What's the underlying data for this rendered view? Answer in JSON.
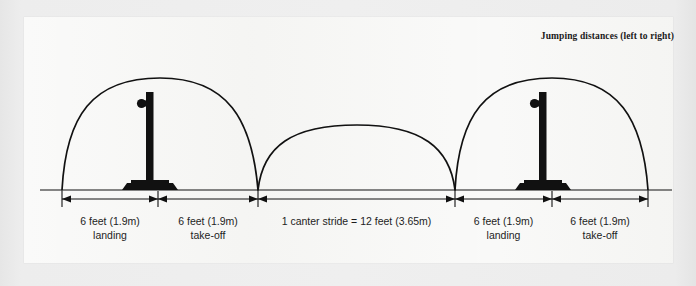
{
  "figure": {
    "title": "Jumping distances (left to right)",
    "ground_line_label": "ground-line",
    "segments": [
      {
        "id": "landing-left",
        "distance": "6 feet (1.9m)",
        "phase": "landing",
        "x_start": 62,
        "x_end": 158
      },
      {
        "id": "takeoff-left",
        "distance": "6 feet (1.9m)",
        "phase": "take-off",
        "x_start": 158,
        "x_end": 258
      },
      {
        "id": "canter-stride",
        "distance": "1 canter stride  =  12 feet (3.65m)",
        "phase": "",
        "x_start": 258,
        "x_end": 455
      },
      {
        "id": "landing-right",
        "distance": "6 feet (1.9m)",
        "phase": "landing",
        "x_start": 455,
        "x_end": 552
      },
      {
        "id": "takeoff-right",
        "distance": "6 feet (1.9m)",
        "phase": "take-off",
        "x_start": 552,
        "x_end": 648
      }
    ],
    "jumps": [
      {
        "id": "jump-left",
        "x": 150
      },
      {
        "id": "jump-right",
        "x": 543
      }
    ],
    "arcs": [
      {
        "id": "arc-jump-left",
        "x_start": 62,
        "x_end": 258,
        "peak_y": 78
      },
      {
        "id": "arc-canter-stride",
        "x_start": 258,
        "x_end": 455,
        "peak_y": 125
      },
      {
        "id": "arc-jump-right",
        "x_start": 455,
        "x_end": 648,
        "peak_y": 78
      }
    ],
    "colors": {
      "ink": "#111111",
      "panel": "#f4f4f2",
      "backdrop": "#e9e9e9",
      "text": "#1d1d1d"
    },
    "geometry": {
      "ground_y": 190,
      "dimension_y": 199,
      "tick_top_y": 191,
      "tick_bottom_y": 207
    }
  }
}
